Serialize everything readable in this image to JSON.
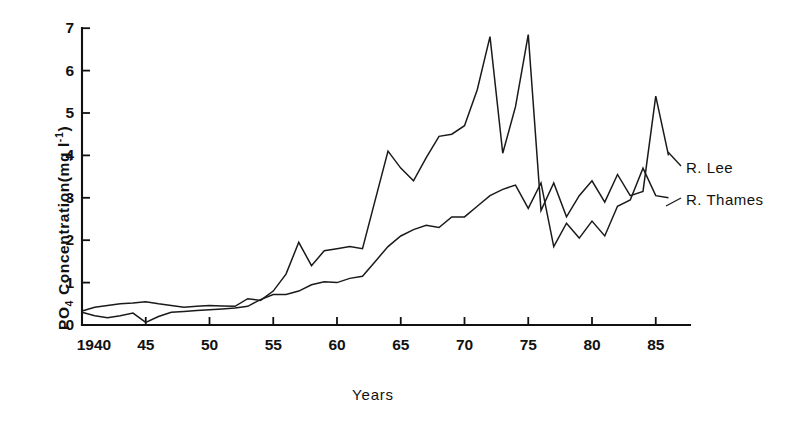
{
  "figure": {
    "name": "po4-concentration-timeseries",
    "background": "#ffffff",
    "ink_color": "#1a1a1a"
  },
  "axes": {
    "y_title_main": "PO",
    "y_title_sub": "4",
    "y_title_rest": " Concentration(mg l",
    "y_title_sup": "-1",
    "y_title_close": ")",
    "y_title_plain": "PO4 Concentration(mg l-1)",
    "x_title": "Years",
    "y_ticks": [
      "0",
      "1",
      "2",
      "3",
      "4",
      "5",
      "6",
      "7"
    ],
    "x_ticks": [
      "1940",
      "45",
      "50",
      "55",
      "60",
      "65",
      "70",
      "75",
      "80",
      "85"
    ]
  },
  "legend": {
    "lee": "R. Lee",
    "thames": "R. Thames"
  },
  "chart_data": {
    "type": "line",
    "title": "",
    "xlabel": "Years",
    "ylabel": "PO4 Concentration(mg l-1)",
    "xlim": [
      1940,
      1987
    ],
    "ylim": [
      0,
      7
    ],
    "grid": false,
    "legend_position": "right-inline",
    "x": [
      1940,
      1941,
      1942,
      1943,
      1944,
      1945,
      1946,
      1947,
      1948,
      1949,
      1950,
      1951,
      1952,
      1953,
      1954,
      1955,
      1956,
      1957,
      1958,
      1959,
      1960,
      1961,
      1962,
      1963,
      1964,
      1965,
      1966,
      1967,
      1968,
      1969,
      1970,
      1971,
      1972,
      1973,
      1974,
      1975,
      1976,
      1977,
      1978,
      1979,
      1980,
      1981,
      1982,
      1983,
      1984,
      1985,
      1986
    ],
    "series": [
      {
        "name": "R. Lee",
        "values": [
          0.33,
          0.42,
          0.46,
          0.5,
          0.52,
          0.55,
          0.5,
          0.46,
          0.42,
          0.44,
          0.46,
          0.45,
          0.44,
          0.62,
          0.58,
          0.8,
          1.2,
          1.95,
          1.4,
          1.75,
          1.8,
          1.85,
          1.8,
          2.95,
          4.1,
          3.7,
          3.4,
          3.95,
          4.45,
          4.5,
          4.7,
          5.55,
          6.8,
          4.05,
          5.15,
          6.85,
          2.7,
          3.35,
          2.55,
          3.05,
          3.4,
          2.9,
          3.55,
          3.05,
          3.15,
          5.4,
          4.0
        ]
      },
      {
        "name": "R. Thames",
        "values": [
          0.3,
          0.22,
          0.17,
          0.22,
          0.28,
          0.06,
          0.2,
          0.3,
          0.32,
          0.34,
          0.36,
          0.38,
          0.4,
          0.44,
          0.6,
          0.72,
          0.72,
          0.8,
          0.95,
          1.02,
          1.0,
          1.1,
          1.15,
          1.5,
          1.85,
          2.1,
          2.25,
          2.35,
          2.3,
          2.55,
          2.55,
          2.8,
          3.05,
          3.2,
          3.3,
          2.75,
          3.35,
          1.85,
          2.4,
          2.05,
          2.45,
          2.1,
          2.8,
          2.95,
          3.7,
          3.05,
          3.0
        ]
      }
    ]
  },
  "geometry": {
    "x_origin_px": 82,
    "x_px_per_year": 12.75,
    "y_zero_px": 325,
    "y_px_per_unit": 42.4,
    "axis_right_px": 690
  }
}
